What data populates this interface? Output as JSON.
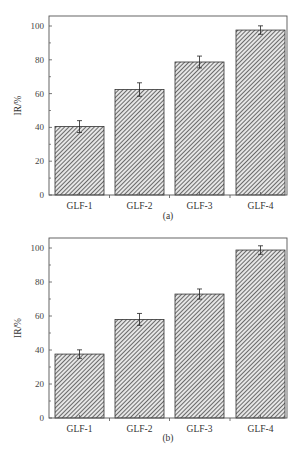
{
  "chart_data": [
    {
      "type": "bar",
      "panel": "(a)",
      "title": "",
      "xlabel": "",
      "ylabel": "IR/%",
      "ylim": [
        0,
        105
      ],
      "yticks": [
        0,
        20,
        40,
        60,
        80,
        100
      ],
      "grid": false,
      "legend": null,
      "categories": [
        "GLF-1",
        "GLF-2",
        "GLF-3",
        "GLF-4"
      ],
      "values": [
        40.5,
        62.4,
        78.7,
        97.6
      ],
      "error": [
        3.5,
        4.0,
        3.5,
        2.5
      ],
      "caption": "(a)"
    },
    {
      "type": "bar",
      "panel": "(b)",
      "title": "",
      "xlabel": "",
      "ylabel": "IR/%",
      "ylim": [
        0,
        105
      ],
      "yticks": [
        0,
        20,
        40,
        60,
        80,
        100
      ],
      "grid": false,
      "legend": null,
      "categories": [
        "GLF-1",
        "GLF-2",
        "GLF-3",
        "GLF-4"
      ],
      "values": [
        37.6,
        58.0,
        72.9,
        98.8
      ],
      "error": [
        2.5,
        3.5,
        3.0,
        2.5
      ],
      "caption": "(b)"
    }
  ],
  "style": {
    "bar_fill_pattern": "diagonal-hatch",
    "bar_stroke": "#333333",
    "hatch_color": "#555555",
    "axis_color": "#555555"
  },
  "layout": {
    "panels": [
      {
        "frame_left": 49,
        "frame_top": 16,
        "frame_right": 287,
        "baseline_y": 195,
        "px_per_unit": 1.69,
        "caption_y": 219
      },
      {
        "frame_left": 49,
        "frame_top": 238,
        "frame_right": 287,
        "baseline_y": 418,
        "px_per_unit": 1.7,
        "caption_y": 441
      }
    ],
    "bars_x": [
      [
        55,
        104
      ],
      [
        115,
        164
      ],
      [
        175,
        224
      ],
      [
        236,
        285
      ]
    ]
  }
}
